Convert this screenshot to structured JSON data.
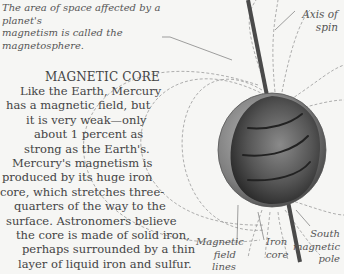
{
  "caption": {
    "lines": [
      "The area of space affected by a planet's",
      "magnetism is called the magnetosphere."
    ]
  },
  "labels": {
    "axis_of_spin": [
      "Axis of",
      "spin"
    ],
    "magnetic_field_lines": [
      "Magnetic",
      "field lines"
    ],
    "iron_core": [
      "Iron",
      "core"
    ],
    "south_magnetic_pole": [
      "South",
      "magnetic",
      "pole"
    ]
  },
  "article": {
    "title": "MAGNETIC CORE",
    "lines": [
      "Like the Earth, Mercury",
      "has a magnetic field, but",
      "it is very weak—only",
      "about 1 percent as",
      "strong as the Earth's.",
      "Mercury's magnetism is",
      "produced by its huge iron",
      "core, which stretches three-",
      "quarters of the way to the",
      "surface. Astronomers believe",
      "the core is made of solid iron,",
      "perhaps surrounded by a thin",
      "layer of liquid iron and sulfur."
    ]
  },
  "colors": {
    "background": "#f6f6f4",
    "text": "#444444",
    "field_line": "#9a9a9a",
    "axis": "#4a4a4a"
  }
}
